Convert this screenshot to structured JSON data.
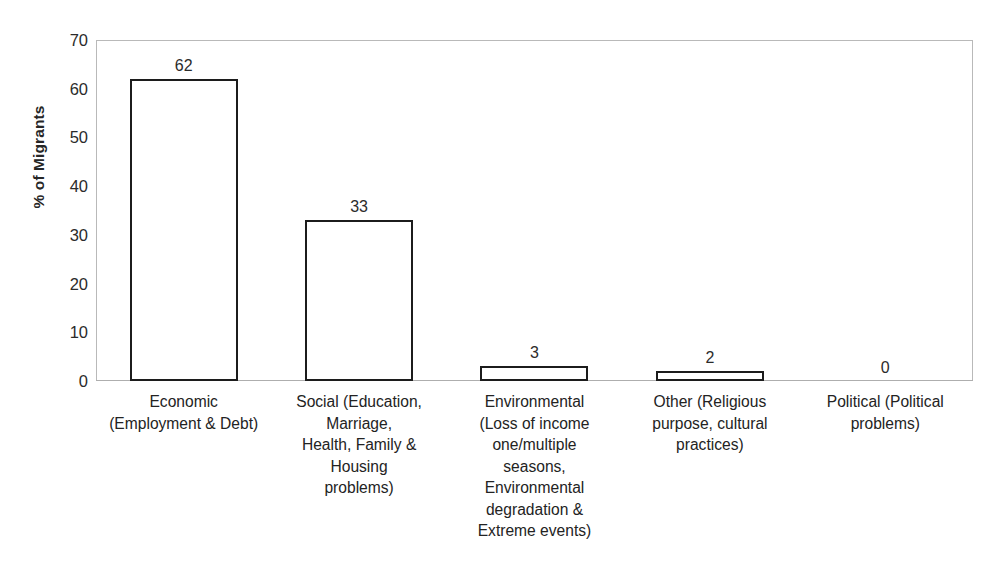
{
  "chart_data": {
    "type": "bar",
    "title": "",
    "xlabel": "",
    "ylabel": "% of Migrants",
    "ylim": [
      0,
      70
    ],
    "ytick_step": 10,
    "yticks": [
      "70",
      "60",
      "50",
      "40",
      "30",
      "20",
      "10",
      "0"
    ],
    "grid": false,
    "legend": null,
    "categories": [
      "Economic (Employment & Debt)",
      "Social (Education, Marriage, Health, Family & Housing problems)",
      "Environmental (Loss of income one/multiple seasons, Environmental degradation & Extreme events)",
      "Other (Religious purpose, cultural practices)",
      "Political (Political problems)"
    ],
    "category_label_lines": [
      [
        "Economic",
        "(Employment & Debt)"
      ],
      [
        "Social (Education,",
        "Marriage,",
        "Health, Family &",
        "Housing",
        "problems)"
      ],
      [
        "Environmental",
        "(Loss of income",
        "one/multiple",
        "seasons,",
        "Environmental",
        "degradation &",
        "Extreme events)"
      ],
      [
        "Other (Religious",
        "purpose, cultural",
        "practices)"
      ],
      [
        "Political (Political",
        "problems)"
      ]
    ],
    "values": [
      62,
      33,
      3,
      2,
      0
    ],
    "value_labels": [
      "62",
      "33",
      "3",
      "2",
      "0"
    ],
    "bar_fill": "#ffffff",
    "bar_edge": "#1c1c1c",
    "axis_color": "#b9b9b9",
    "text_color": "#232323"
  }
}
